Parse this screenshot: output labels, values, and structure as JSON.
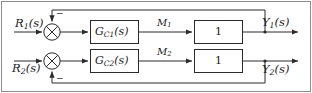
{
  "figure": {
    "border_color": "#8c8c8c",
    "line_color": "#2b2b2b",
    "block_fill": "#ffffff",
    "block_border": "#2b2b2b",
    "text_color": "#1a1a1a"
  },
  "inputs": [
    {
      "id": "r1",
      "name": "R",
      "sub": "1",
      "arg": "(s)",
      "label": "R1(s)"
    },
    {
      "id": "r2",
      "name": "R",
      "sub": "2",
      "arg": "(s)",
      "label": "R2(s)"
    }
  ],
  "summing_junctions": [
    {
      "id": "sum1",
      "sign_feedback": "−",
      "style": "circle-cross"
    },
    {
      "id": "sum2",
      "sign_feedback": "−",
      "style": "circle-cross"
    }
  ],
  "controller_blocks": [
    {
      "id": "gc1",
      "name": "G",
      "sub": "C1",
      "arg": "(s)",
      "label": "GC1(s)"
    },
    {
      "id": "gc2",
      "name": "G",
      "sub": "C2",
      "arg": "(s)",
      "label": "GC2(s)"
    }
  ],
  "intermediate_signals": [
    {
      "id": "m1",
      "name": "M",
      "sub": "1",
      "label": "M1"
    },
    {
      "id": "m2",
      "name": "M",
      "sub": "2",
      "label": "M2"
    }
  ],
  "plant_blocks": [
    {
      "id": "p1",
      "label": "1"
    },
    {
      "id": "p2",
      "label": "1"
    }
  ],
  "outputs": [
    {
      "id": "y1",
      "name": "Y",
      "sub": "1",
      "arg": "(s)",
      "label": "Y1(s)"
    },
    {
      "id": "y2",
      "name": "Y",
      "sub": "2",
      "arg": "(s)",
      "label": "Y2(s)"
    }
  ],
  "feedback_paths": [
    {
      "id": "fb1",
      "from": "y1",
      "to": "sum1",
      "route": "top",
      "sign": "−"
    },
    {
      "id": "fb2",
      "from": "y2",
      "to": "sum2",
      "route": "bottom",
      "sign": "−"
    }
  ]
}
